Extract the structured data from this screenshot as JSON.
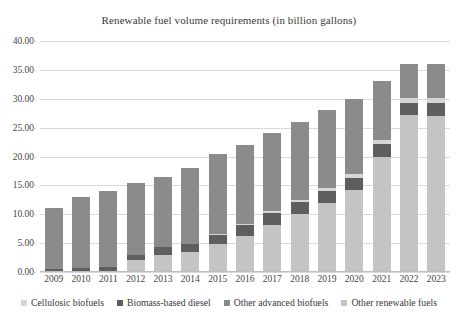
{
  "chart_data": {
    "type": "bar",
    "stacked": true,
    "title": "Renewable fuel volume requirements (in billion gallons)",
    "xlabel": "",
    "ylabel": "",
    "ylim": [
      0,
      40
    ],
    "ytick_values": [
      0,
      5,
      10,
      15,
      20,
      25,
      30,
      35,
      40
    ],
    "ytick_labels": [
      "0.00",
      "5.00",
      "10.00",
      "15.00",
      "20.00",
      "25.00",
      "30.00",
      "35.00",
      "40.00"
    ],
    "grid": true,
    "legend_position": "bottom",
    "categories": [
      "2009",
      "2010",
      "2011",
      "2012",
      "2013",
      "2014",
      "2015",
      "2016",
      "2017",
      "2018",
      "2019",
      "2020",
      "2021",
      "2022",
      "2023"
    ],
    "series": [
      {
        "name": "Cellulosic biofuels",
        "color": "#d5d5d5",
        "values": [
          0.0,
          0.0,
          0.0,
          0.0,
          0.0,
          0.0,
          0.1,
          0.2,
          0.3,
          0.4,
          0.5,
          0.6,
          0.7,
          0.8,
          0.9
        ]
      },
      {
        "name": "Biomass-based diesel",
        "color": "#5e5e5e",
        "values": [
          0.5,
          0.65,
          0.8,
          1.0,
          1.28,
          1.28,
          1.73,
          1.9,
          2.0,
          2.1,
          2.1,
          2.1,
          2.1,
          2.1,
          2.1
        ]
      },
      {
        "name": "Other advanced biofuels",
        "color": "#8b8b8b",
        "values": [
          10.6,
          12.35,
          13.2,
          12.5,
          12.22,
          13.22,
          13.87,
          13.6,
          13.5,
          13.5,
          13.5,
          13.1,
          10.2,
          5.9,
          5.9
        ]
      },
      {
        "name": "Other renewable fuels",
        "color": "#c4c4c4",
        "values": [
          0.0,
          0.0,
          0.0,
          2.0,
          3.0,
          3.5,
          4.8,
          6.3,
          8.2,
          10.0,
          11.9,
          14.2,
          20.0,
          27.2,
          27.1
        ]
      }
    ],
    "totals": [
      11.1,
      13.0,
      14.0,
      15.5,
      16.5,
      18.0,
      20.5,
      22.0,
      24.0,
      26.0,
      28.0,
      30.0,
      33.0,
      36.0,
      36.0
    ],
    "stack_order_bottom_to_top": [
      "Other renewable fuels",
      "Biomass-based diesel",
      "Cellulosic biofuels",
      "Other advanced biofuels"
    ]
  },
  "legend": {
    "items": [
      {
        "label": "Cellulosic biofuels",
        "color": "#d5d5d5"
      },
      {
        "label": "Biomass-based diesel",
        "color": "#5e5e5e"
      },
      {
        "label": "Other advanced biofuels",
        "color": "#8b8b8b"
      },
      {
        "label": "Other renewable fuels",
        "color": "#c4c4c4"
      }
    ]
  }
}
